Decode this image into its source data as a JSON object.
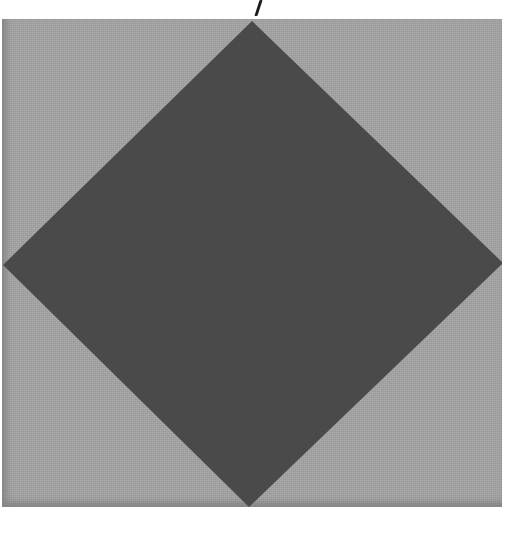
{
  "image": {
    "description": "Gray square tile with a dark gray diamond inscribed, corners touching each edge midpoint",
    "colors": {
      "background": "#ffffff",
      "tile": "#a3a3a3",
      "diamond": "#4a4a4a",
      "mark": "#1a1a1a"
    },
    "shapes": {
      "tile": {
        "x": 2,
        "y": 19,
        "width": 500,
        "height": 488
      },
      "diamond_points": [
        [
          252,
          21
        ],
        [
          503,
          263
        ],
        [
          249,
          507
        ],
        [
          3,
          265
        ]
      ]
    }
  }
}
